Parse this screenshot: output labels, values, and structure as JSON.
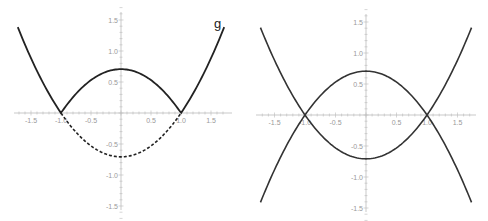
{
  "chart_data": [
    {
      "type": "line",
      "title": "",
      "xlabel": "",
      "ylabel": "",
      "xlim": [
        -1.75,
        1.75
      ],
      "ylim": [
        -1.6,
        1.6
      ],
      "x_ticks": [
        "-1.5",
        "-1.0",
        "-0.5",
        "0.5",
        "1.0",
        "1.5"
      ],
      "y_ticks": [
        "1.5",
        "1.0",
        "0.5",
        "-0.5",
        "-1.0",
        "-1.5"
      ],
      "grid": false,
      "annotations": [
        {
          "text": "g",
          "x": 1.6,
          "y": 1.45
        }
      ],
      "series": [
        {
          "name": "g upper (solid)",
          "style": "solid",
          "x": [
            -1.7,
            -1.0,
            -0.5,
            0,
            0.5,
            1.0,
            1.7
          ],
          "y": [
            1.34,
            0,
            0.53,
            0.707,
            0.53,
            0,
            1.34
          ],
          "description": "|x^2-1|/sqrt(2) drawn solid"
        },
        {
          "name": "lower (dashed)",
          "style": "dashed",
          "x": [
            -1.0,
            -0.5,
            0,
            0.5,
            1.0
          ],
          "y": [
            0,
            -0.53,
            -0.707,
            -0.53,
            0
          ]
        }
      ]
    },
    {
      "type": "line",
      "title": "",
      "xlabel": "",
      "ylabel": "",
      "xlim": [
        -1.75,
        1.75
      ],
      "ylim": [
        -1.6,
        1.6
      ],
      "x_ticks": [
        "-1.5",
        "-1.0",
        "-0.5",
        "0.5",
        "1.0",
        "1.5"
      ],
      "y_ticks": [
        "1.5",
        "1.0",
        "0.5",
        "-0.5",
        "-1.0",
        "-1.5"
      ],
      "grid": false,
      "series": [
        {
          "name": "(x^2-1)/sqrt(2)",
          "style": "solid",
          "x": [
            -1.7,
            -1.0,
            0,
            1.0,
            1.7
          ],
          "y": [
            1.34,
            0,
            -0.707,
            0,
            1.34
          ]
        },
        {
          "name": "-(x^2-1)/sqrt(2)",
          "style": "solid",
          "x": [
            -1.7,
            -1.0,
            0,
            1.0,
            1.7
          ],
          "y": [
            -1.34,
            0,
            0.707,
            0,
            -1.34
          ]
        }
      ]
    }
  ],
  "left": {
    "curve_label": "g"
  },
  "ticks": {
    "x": [
      "-1.5",
      "-1.0",
      "-0.5",
      "0.5",
      "1.0",
      "1.5"
    ],
    "y": [
      "1.5",
      "1.0",
      "0.5",
      "-0.5",
      "-1.0",
      "-1.5"
    ]
  }
}
